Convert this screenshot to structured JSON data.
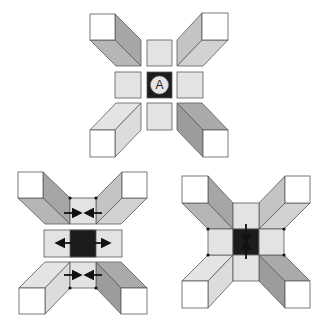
{
  "colors": {
    "background": "#ffffff",
    "stroke": "#5a5a5a",
    "white_face": "#ffffff",
    "light_square": "#e3e3e3",
    "dark_square": "#1c1c1c",
    "circle_fill": "#e6e6e6",
    "arrow": "#111111",
    "dot": "#111111",
    "shade_dark_side": "#9c9c9c",
    "shade_dark_face": "#aaaaaa",
    "shade_mid_side": "#a6a6a6",
    "shade_mid_face": "#b6b6b6",
    "shade_light_side": "#c4c4c4",
    "shade_light_face": "#d2d2d2",
    "shade_pale_side": "#dcdcdc",
    "shade_pale_face": "#e4e4e4"
  },
  "diagrams": [
    {
      "name": "top-diagram",
      "center_label": "A",
      "squares": [
        {
          "name": "center-top-square",
          "x": 147,
          "y": 40,
          "w": 25,
          "h": 26,
          "fill": "light"
        },
        {
          "name": "center-left-square",
          "x": 115,
          "y": 72,
          "w": 26,
          "h": 26,
          "fill": "light"
        },
        {
          "name": "center-dark-square",
          "x": 147,
          "y": 72,
          "w": 25,
          "h": 26,
          "fill": "dark"
        },
        {
          "name": "center-right-square",
          "x": 177,
          "y": 72,
          "w": 26,
          "h": 26,
          "fill": "light"
        },
        {
          "name": "center-bottom-square",
          "x": 147,
          "y": 103,
          "w": 25,
          "h": 27,
          "fill": "light"
        }
      ],
      "prisms": [
        {
          "name": "prism-top-left",
          "cap": [
            90,
            14,
            25,
            26
          ],
          "faces": [
            {
              "pts": [
                [
                  115,
                  14
                ],
                [
                  141,
                  40
                ],
                [
                  141,
                  66
                ],
                [
                  115,
                  40
                ]
              ],
              "fill": "mid_side"
            },
            {
              "pts": [
                [
                  90,
                  40
                ],
                [
                  115,
                  40
                ],
                [
                  141,
                  66
                ],
                [
                  116,
                  66
                ]
              ],
              "fill": "mid_face"
            }
          ]
        },
        {
          "name": "prism-top-right",
          "cap": [
            202,
            13,
            26,
            27
          ],
          "faces": [
            {
              "pts": [
                [
                  202,
                  13
                ],
                [
                  177,
                  40
                ],
                [
                  177,
                  66
                ],
                [
                  202,
                  40
                ]
              ],
              "fill": "light_side"
            },
            {
              "pts": [
                [
                  202,
                  40
                ],
                [
                  228,
                  40
                ],
                [
                  203,
                  66
                ],
                [
                  177,
                  66
                ]
              ],
              "fill": "light_face"
            }
          ]
        },
        {
          "name": "prism-bottom-left",
          "cap": [
            90,
            130,
            25,
            27
          ],
          "faces": [
            {
              "pts": [
                [
                  116,
                  103
                ],
                [
                  141,
                  103
                ],
                [
                  115,
                  130
                ],
                [
                  90,
                  130
                ]
              ],
              "fill": "pale_face"
            },
            {
              "pts": [
                [
                  141,
                  103
                ],
                [
                  141,
                  130
                ],
                [
                  115,
                  157
                ],
                [
                  115,
                  130
                ]
              ],
              "fill": "pale_side"
            }
          ]
        },
        {
          "name": "prism-bottom-right",
          "cap": [
            203,
            130,
            25,
            27
          ],
          "faces": [
            {
              "pts": [
                [
                  177,
                  103
                ],
                [
                  202,
                  103
                ],
                [
                  228,
                  130
                ],
                [
                  203,
                  130
                ]
              ],
              "fill": "dark_face"
            },
            {
              "pts": [
                [
                  177,
                  103
                ],
                [
                  203,
                  130
                ],
                [
                  203,
                  157
                ],
                [
                  177,
                  130
                ]
              ],
              "fill": "dark_side"
            }
          ]
        }
      ],
      "circle": {
        "cx": 159.5,
        "cy": 85,
        "r": 9
      },
      "arrows": [],
      "dots": []
    },
    {
      "name": "bottom-left-diagram",
      "squares": [
        {
          "name": "top-center-square",
          "x": 70,
          "y": 198,
          "w": 26,
          "h": 26,
          "fill": "light"
        },
        {
          "name": "middle-bar",
          "x": 44,
          "y": 230,
          "w": 78,
          "h": 27,
          "fill": "light"
        },
        {
          "name": "middle-dark-square",
          "x": 70,
          "y": 230,
          "w": 26,
          "h": 27,
          "fill": "dark"
        },
        {
          "name": "bottom-center-square",
          "x": 70,
          "y": 262,
          "w": 26,
          "h": 26,
          "fill": "light"
        }
      ],
      "prisms": [
        {
          "name": "prism-top-left",
          "cap": [
            18,
            172,
            25,
            26
          ],
          "faces": [
            {
              "pts": [
                [
                  43,
                  172
                ],
                [
                  70,
                  198
                ],
                [
                  70,
                  224
                ],
                [
                  43,
                  198
                ]
              ],
              "fill": "mid_side"
            },
            {
              "pts": [
                [
                  18,
                  198
                ],
                [
                  43,
                  198
                ],
                [
                  70,
                  224
                ],
                [
                  45,
                  224
                ]
              ],
              "fill": "mid_face"
            }
          ]
        },
        {
          "name": "prism-top-right",
          "cap": [
            122,
            172,
            25,
            26
          ],
          "faces": [
            {
              "pts": [
                [
                  122,
                  172
                ],
                [
                  96,
                  198
                ],
                [
                  96,
                  224
                ],
                [
                  122,
                  198
                ]
              ],
              "fill": "light_side"
            },
            {
              "pts": [
                [
                  122,
                  198
                ],
                [
                  147,
                  198
                ],
                [
                  121,
                  224
                ],
                [
                  96,
                  224
                ]
              ],
              "fill": "light_face"
            }
          ]
        },
        {
          "name": "prism-bottom-left",
          "cap": [
            19,
            288,
            26,
            26
          ],
          "faces": [
            {
              "pts": [
                [
                  45,
                  262
                ],
                [
                  70,
                  262
                ],
                [
                  45,
                  288
                ],
                [
                  19,
                  288
                ]
              ],
              "fill": "pale_face"
            },
            {
              "pts": [
                [
                  70,
                  262
                ],
                [
                  70,
                  288
                ],
                [
                  45,
                  314
                ],
                [
                  45,
                  288
                ]
              ],
              "fill": "pale_side"
            }
          ]
        },
        {
          "name": "prism-bottom-right",
          "cap": [
            121,
            288,
            26,
            26
          ],
          "faces": [
            {
              "pts": [
                [
                  96,
                  262
                ],
                [
                  121,
                  262
                ],
                [
                  147,
                  288
                ],
                [
                  121,
                  288
                ]
              ],
              "fill": "dark_face"
            },
            {
              "pts": [
                [
                  96,
                  262
                ],
                [
                  121,
                  288
                ],
                [
                  121,
                  314
                ],
                [
                  96,
                  288
                ]
              ],
              "fill": "dark_side"
            }
          ]
        }
      ],
      "arrows": [
        {
          "name": "arrow-top-pointing-right",
          "x1": 64,
          "y1": 213,
          "x2": 79,
          "y2": 213
        },
        {
          "name": "arrow-top-pointing-left",
          "x1": 102,
          "y1": 213,
          "x2": 87,
          "y2": 213
        },
        {
          "name": "arrow-middle-pointing-left",
          "x1": 72,
          "y1": 243,
          "x2": 58,
          "y2": 243
        },
        {
          "name": "arrow-middle-pointing-right",
          "x1": 94,
          "y1": 243,
          "x2": 108,
          "y2": 243
        },
        {
          "name": "arrow-bottom-pointing-right",
          "x1": 64,
          "y1": 275,
          "x2": 79,
          "y2": 275
        },
        {
          "name": "arrow-bottom-pointing-left",
          "x1": 102,
          "y1": 275,
          "x2": 87,
          "y2": 275
        }
      ],
      "dots": [
        [
          70,
          198
        ],
        [
          96,
          198
        ],
        [
          70,
          288
        ],
        [
          96,
          288
        ]
      ]
    },
    {
      "name": "bottom-right-diagram",
      "squares": [
        {
          "name": "top-center-square",
          "x": 233,
          "y": 203,
          "w": 26,
          "h": 26,
          "fill": "light"
        },
        {
          "name": "left-square",
          "x": 208,
          "y": 229,
          "w": 25,
          "h": 26,
          "fill": "light"
        },
        {
          "name": "center-dark-square",
          "x": 233,
          "y": 229,
          "w": 26,
          "h": 26,
          "fill": "dark"
        },
        {
          "name": "right-square",
          "x": 259,
          "y": 229,
          "w": 25,
          "h": 26,
          "fill": "light"
        },
        {
          "name": "bottom-center-square",
          "x": 233,
          "y": 255,
          "w": 26,
          "h": 26,
          "fill": "light"
        }
      ],
      "prisms": [
        {
          "name": "prism-top-left",
          "cap": [
            182,
            176,
            26,
            27
          ],
          "faces": [
            {
              "pts": [
                [
                  208,
                  176
                ],
                [
                  233,
                  203
                ],
                [
                  233,
                  229
                ],
                [
                  208,
                  203
                ]
              ],
              "fill": "mid_side"
            },
            {
              "pts": [
                [
                  182,
                  203
                ],
                [
                  208,
                  203
                ],
                [
                  233,
                  229
                ],
                [
                  208,
                  229
                ]
              ],
              "fill": "mid_face"
            }
          ]
        },
        {
          "name": "prism-top-right",
          "cap": [
            285,
            176,
            25,
            27
          ],
          "faces": [
            {
              "pts": [
                [
                  285,
                  176
                ],
                [
                  259,
                  203
                ],
                [
                  259,
                  229
                ],
                [
                  285,
                  203
                ]
              ],
              "fill": "light_side"
            },
            {
              "pts": [
                [
                  285,
                  203
                ],
                [
                  310,
                  203
                ],
                [
                  284,
                  229
                ],
                [
                  259,
                  229
                ]
              ],
              "fill": "light_face"
            }
          ]
        },
        {
          "name": "prism-bottom-left",
          "cap": [
            182,
            281,
            26,
            27
          ],
          "faces": [
            {
              "pts": [
                [
                  208,
                  255
                ],
                [
                  233,
                  255
                ],
                [
                  208,
                  281
                ],
                [
                  182,
                  281
                ]
              ],
              "fill": "pale_face"
            },
            {
              "pts": [
                [
                  233,
                  255
                ],
                [
                  233,
                  281
                ],
                [
                  208,
                  308
                ],
                [
                  208,
                  281
                ]
              ],
              "fill": "pale_side"
            }
          ]
        },
        {
          "name": "prism-bottom-right",
          "cap": [
            285,
            281,
            25,
            27
          ],
          "faces": [
            {
              "pts": [
                [
                  259,
                  255
                ],
                [
                  284,
                  255
                ],
                [
                  310,
                  281
                ],
                [
                  285,
                  281
                ]
              ],
              "fill": "dark_face"
            },
            {
              "pts": [
                [
                  259,
                  255
                ],
                [
                  285,
                  281
                ],
                [
                  285,
                  308
                ],
                [
                  259,
                  281
                ]
              ],
              "fill": "dark_side"
            }
          ]
        }
      ],
      "arrows": [
        {
          "name": "arrow-pointing-down",
          "x1": 246,
          "y1": 224,
          "x2": 246,
          "y2": 241
        },
        {
          "name": "arrow-pointing-up",
          "x1": 246,
          "y1": 259,
          "x2": 246,
          "y2": 243
        }
      ],
      "dots": [
        [
          208,
          229
        ],
        [
          284,
          229
        ],
        [
          208,
          255
        ],
        [
          284,
          255
        ]
      ]
    }
  ]
}
